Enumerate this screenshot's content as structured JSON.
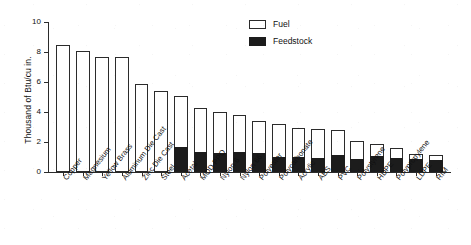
{
  "chart_data": {
    "type": "bar",
    "stacked": true,
    "title": "",
    "xlabel": "",
    "ylabel": "Thousand of Btu/cu in.",
    "ylim": [
      0,
      10
    ],
    "yticks": [
      0,
      2,
      4,
      6,
      8,
      10
    ],
    "grid": false,
    "legend_position": "top-center-right",
    "categories": [
      "Copper",
      "Magnesium",
      "Yellow Brass",
      "Aluminum Die Cast",
      "Zinc Die Cast",
      "Steel",
      "Acetal",
      "MOD PPO",
      "Nylon 6",
      "Nylon 66",
      "Polyester",
      "Polycarbonate",
      "Acrylic",
      "ABS",
      "PVC",
      "Polystyrene",
      "HDPE",
      "Polypropylene",
      "LDPE",
      "RIM"
    ],
    "series": [
      {
        "name": "Feedstock",
        "color": "#1c1c1c",
        "values": [
          0,
          0,
          0,
          0,
          0,
          0,
          1.65,
          1.35,
          1.3,
          1.35,
          1.25,
          1.0,
          1.0,
          0.95,
          1.15,
          0.9,
          1.05,
          0.95,
          0.85,
          0.8
        ]
      },
      {
        "name": "Fuel",
        "color": "#ffffff",
        "values": [
          8.45,
          8.1,
          7.65,
          7.65,
          5.85,
          5.4,
          3.4,
          2.9,
          2.7,
          2.45,
          2.15,
          2.2,
          1.95,
          1.9,
          1.65,
          1.2,
          0.8,
          0.65,
          0.35,
          0.35
        ]
      }
    ],
    "totals": [
      8.45,
      8.1,
      7.65,
      7.65,
      5.85,
      5.4,
      5.05,
      4.25,
      4.0,
      3.8,
      3.4,
      3.2,
      2.95,
      2.85,
      2.8,
      2.1,
      1.85,
      1.6,
      1.2,
      1.15
    ]
  },
  "legend": {
    "items": [
      {
        "label": "Fuel",
        "style": "outline"
      },
      {
        "label": "Feedstock",
        "style": "filled"
      }
    ]
  }
}
